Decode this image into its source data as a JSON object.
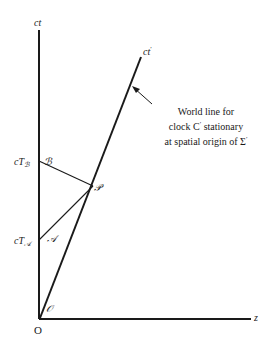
{
  "diagram": {
    "axes": {
      "vertical": "ct",
      "horizontal": "z",
      "moving": "ct",
      "moving_prime": "′",
      "origin": "O"
    },
    "points": {
      "origin_event": "𝒪",
      "event_a": "𝒜",
      "event_b": "ℬ",
      "event_p": "𝒫"
    },
    "ticks": {
      "ta_prefix": "cT",
      "ta_sub": "𝒜",
      "tb_prefix": "cT",
      "tb_sub": "ℬ"
    },
    "annotation": {
      "line1": "World line for",
      "line2_pre": "clock C",
      "line2_prime": "′",
      "line2_post": " stationary",
      "line3_pre": "at spatial origin of Σ",
      "line3_prime": "′"
    },
    "colors": {
      "ink": "#1a1a1a",
      "background": "#ffffff"
    }
  }
}
